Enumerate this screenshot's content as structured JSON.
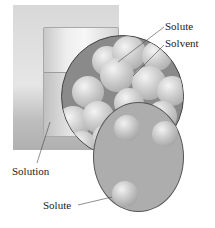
{
  "diagram": {
    "labels": {
      "solute_top": "Solute",
      "solvent": "Solvent",
      "solution": "Solution",
      "solute_bottom": "Solute"
    },
    "colors": {
      "molecule_fill": "#c8c8c8",
      "circle_border": "#444444",
      "solute_background": "#adadad"
    }
  }
}
